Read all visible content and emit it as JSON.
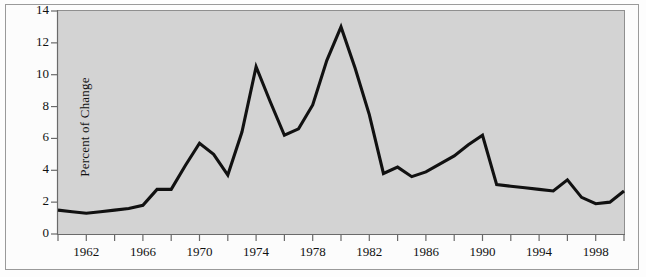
{
  "chart_data": {
    "type": "line",
    "title": "",
    "subtitle": "",
    "xlabel": "",
    "ylabel": "Percent of Change",
    "xlim": [
      1960,
      2000
    ],
    "ylim": [
      0,
      14
    ],
    "grid": false,
    "legend": null,
    "line_color": "#111111",
    "plot_background": "#d3d3d3",
    "y_ticks": [
      0,
      2,
      4,
      6,
      8,
      10,
      12,
      14
    ],
    "y_tick_labels": [
      "0",
      "2",
      "4",
      "6",
      "8",
      "10",
      "12",
      "14"
    ],
    "x_ticks": [
      1960,
      1962,
      1964,
      1966,
      1968,
      1970,
      1972,
      1974,
      1976,
      1978,
      1980,
      1982,
      1984,
      1986,
      1988,
      1990,
      1992,
      1994,
      1996,
      1998,
      2000
    ],
    "x_tick_labels": [
      "1962",
      "1966",
      "1970",
      "1974",
      "1978",
      "1982",
      "1986",
      "1990",
      "1994",
      "1998"
    ],
    "x_tick_label_years": [
      1962,
      1966,
      1970,
      1974,
      1978,
      1982,
      1986,
      1990,
      1994,
      1998
    ],
    "x": [
      1960,
      1961,
      1962,
      1963,
      1964,
      1965,
      1966,
      1967,
      1968,
      1969,
      1970,
      1971,
      1972,
      1973,
      1974,
      1975,
      1976,
      1977,
      1978,
      1979,
      1980,
      1981,
      1982,
      1983,
      1984,
      1985,
      1986,
      1987,
      1988,
      1989,
      1990,
      1991,
      1992,
      1993,
      1994,
      1995,
      1996,
      1997,
      1998,
      1999,
      2000
    ],
    "values": [
      1.5,
      1.4,
      1.3,
      1.4,
      1.5,
      1.6,
      1.8,
      2.8,
      2.8,
      4.3,
      5.7,
      5.0,
      3.7,
      6.4,
      10.5,
      8.3,
      6.2,
      6.6,
      8.1,
      10.9,
      13.0,
      10.4,
      7.5,
      3.8,
      4.2,
      3.6,
      3.9,
      4.4,
      4.9,
      5.6,
      6.2,
      3.1,
      3.0,
      2.9,
      2.8,
      2.7,
      3.4,
      2.3,
      1.9,
      2.0,
      2.7
    ]
  },
  "axes": {
    "y_title": "Percent of Change"
  }
}
